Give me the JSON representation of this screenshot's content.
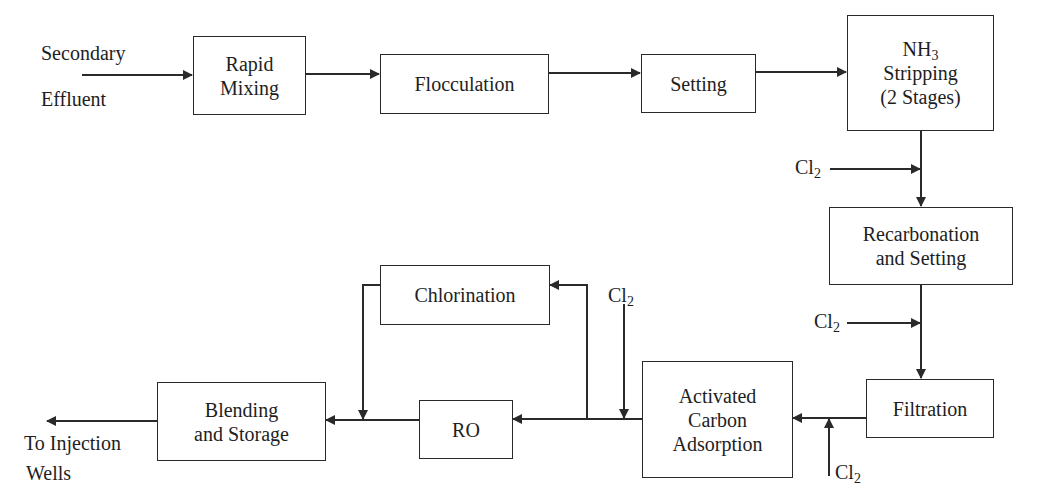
{
  "diagram": {
    "type": "process-flow",
    "title": "",
    "inputs": {
      "source_line1": "Secondary",
      "source_line2": "Effluent",
      "output_line1": "To Injection",
      "output_line2": "Wells"
    },
    "boxes": {
      "rapid_mixing": {
        "line1": "Rapid",
        "line2": "Mixing"
      },
      "flocculation": {
        "line1": "Flocculation"
      },
      "setting": {
        "line1": "Setting"
      },
      "nh3_stripping": {
        "line1_main": "NH",
        "line1_sub": "3",
        "line2": "Stripping",
        "line3": "(2 Stages)"
      },
      "recarbonation": {
        "line1": "Recarbonation",
        "line2": "and Setting"
      },
      "filtration": {
        "line1": "Filtration"
      },
      "activated_carbon": {
        "line1": "Activated",
        "line2": "Carbon",
        "line3": "Adsorption"
      },
      "ro": {
        "line1": "RO"
      },
      "chlorination": {
        "line1": "Chlorination"
      },
      "blending": {
        "line1": "Blending",
        "line2": "and Storage"
      }
    },
    "chemical_inputs": [
      {
        "main": "Cl",
        "sub": "2",
        "target": "between NH3 Stripping and Recarbonation"
      },
      {
        "main": "Cl",
        "sub": "2",
        "target": "between Recarbonation and Filtration"
      },
      {
        "main": "Cl",
        "sub": "2",
        "target": "between Filtration and Activated Carbon"
      },
      {
        "main": "Cl",
        "sub": "2",
        "target": "between Activated Carbon and RO"
      }
    ],
    "flow": [
      "Secondary Effluent",
      "Rapid Mixing",
      "Flocculation",
      "Setting",
      "NH3 Stripping (2 Stages)",
      "Recarbonation and Setting",
      "Filtration",
      "Activated Carbon Adsorption",
      "RO",
      "Blending and Storage",
      "To Injection Wells"
    ],
    "bypass": "Activated Carbon Adsorption output -> Chlorination -> Blending and Storage",
    "colors": {
      "line": "#2a2a2a",
      "background": "#ffffff"
    }
  }
}
